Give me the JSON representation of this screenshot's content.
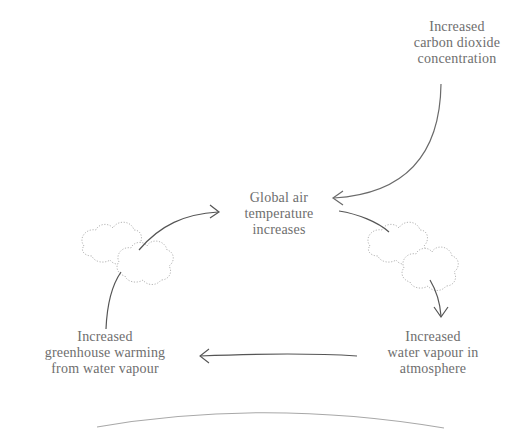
{
  "diagram": {
    "type": "feedback-loop",
    "colors": {
      "text": "#6e6e6e",
      "arrow": "#555555",
      "cloud_outline": "#b0b0b0",
      "ground": "#a8a8a8",
      "background": "#ffffff"
    },
    "nodes": [
      {
        "id": "co2",
        "lines": [
          "Increased",
          "carbon dioxide",
          "concentration"
        ]
      },
      {
        "id": "temp",
        "lines": [
          "Global air",
          "temperature",
          "increases"
        ]
      },
      {
        "id": "vapour",
        "lines": [
          "Increased",
          "water vapour in",
          "atmosphere"
        ]
      },
      {
        "id": "greenhouse",
        "lines": [
          "Increased",
          "greenhouse warming",
          "from water vapour"
        ]
      }
    ],
    "edges": [
      {
        "from": "co2",
        "to": "temp"
      },
      {
        "from": "temp",
        "to": "vapour"
      },
      {
        "from": "vapour",
        "to": "greenhouse"
      },
      {
        "from": "greenhouse",
        "to": "temp"
      }
    ],
    "decorations": [
      "cloud-left",
      "cloud-right",
      "earth-horizon"
    ]
  }
}
